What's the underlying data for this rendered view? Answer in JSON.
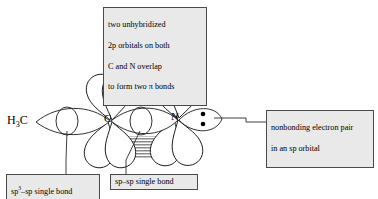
{
  "figure": {
    "kind": "orbital-diagram",
    "molecule": "H3C-C≡N (acetonitrile)",
    "background_color": "#ffffff",
    "line_color": "#1a1a1a",
    "hatch_color": "#8c8c8c",
    "callout_fill": "#e9e9e9",
    "callout_border": "#4a4a4a"
  },
  "atoms": {
    "methyl_label": "H",
    "methyl_sub": "3",
    "methyl_label_tail": "C",
    "carbon_label": "C",
    "nitrogen_label": "N"
  },
  "callouts": {
    "pi_bonds": {
      "line1": "two unhybridized",
      "line2": "2p orbitals on both",
      "line3": "C and N overlap",
      "line4": "to form two π bonds"
    },
    "lone_pair": {
      "line1": "nonbonding electron pair",
      "line2": "in an sp orbital"
    },
    "sp3_sp_bond": {
      "prefix": "sp",
      "superscript": "3",
      "suffix": "–sp single bond"
    },
    "sp_sp_bond": {
      "text": "sp–sp single bond"
    }
  },
  "lone_pair": {
    "electron_count": 2,
    "dot_color": "#000000"
  }
}
